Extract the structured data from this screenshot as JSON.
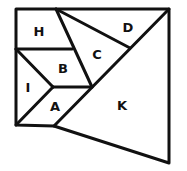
{
  "diagram": {
    "stroke_color": "#111111",
    "background": "#ffffff",
    "regions": [
      {
        "id": "H",
        "label": "H",
        "x": 39,
        "y": 31
      },
      {
        "id": "D",
        "label": "D",
        "x": 128,
        "y": 27
      },
      {
        "id": "C",
        "label": "C",
        "x": 97,
        "y": 54
      },
      {
        "id": "B",
        "label": "B",
        "x": 63,
        "y": 68
      },
      {
        "id": "I",
        "label": "I",
        "x": 28,
        "y": 87
      },
      {
        "id": "A",
        "label": "A",
        "x": 55,
        "y": 106
      },
      {
        "id": "K",
        "label": "K",
        "x": 122,
        "y": 105
      }
    ]
  }
}
